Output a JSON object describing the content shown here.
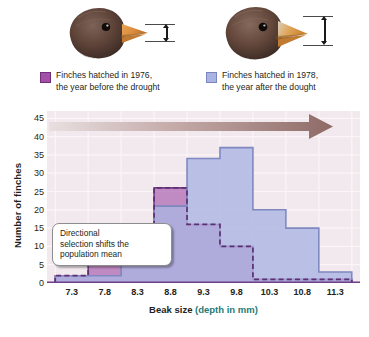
{
  "illustrations": {
    "left_bird": {
      "name": "finch-head-1976",
      "alt": "Finch head with smaller beak"
    },
    "right_bird": {
      "name": "finch-head-1978",
      "alt": "Finch head with deeper beak"
    },
    "gauge_label": "beak depth measurement"
  },
  "legend": {
    "items": [
      {
        "label": "Finches hatched in 1976,\nthe year before the drought",
        "color": "#a24fa8"
      },
      {
        "label": "Finches hatched in 1978,\nthe year after the dought",
        "color": "#aab4e2"
      }
    ]
  },
  "callout": {
    "text": "Directional\nselection shifts the\npopulation mean"
  },
  "chart_data": {
    "type": "bar",
    "title": "",
    "xlabel": "Beak size (depth in mm)",
    "xlabel_main": "Beak size ",
    "xlabel_paren": "(depth in mm)",
    "ylabel": "Number of finches",
    "categories": [
      "7.3",
      "7.8",
      "8.3",
      "8.8",
      "9.3",
      "9.8",
      "10.3",
      "10.8",
      "11.3"
    ],
    "xticks": [
      "7.3",
      "7.8",
      "8.3",
      "8.8",
      "9.3",
      "9.8",
      "10.3",
      "10.8",
      "11.3"
    ],
    "yticks": [
      0,
      5,
      10,
      15,
      20,
      25,
      30,
      35,
      40,
      45
    ],
    "ylim": [
      0,
      47
    ],
    "grid": true,
    "legend_position": "above-plot",
    "series": [
      {
        "name": "Finches hatched in 1976, the year before the drought",
        "color": "#a24fa8",
        "values": [
          2,
          8,
          15,
          26,
          16,
          10,
          1,
          1,
          1
        ]
      },
      {
        "name": "Finches hatched in 1978, the year after the dought",
        "color": "#aab4e2",
        "values": [
          2,
          2,
          5,
          21,
          34,
          37,
          20,
          15,
          3
        ]
      }
    ],
    "annotation": {
      "text": "Directional selection shifts the population mean",
      "arrow": "rightward-gradient-arrow"
    }
  }
}
